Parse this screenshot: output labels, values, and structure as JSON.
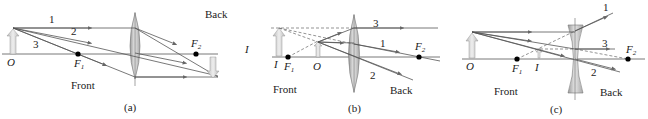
{
  "panels": [
    {
      "id": "a",
      "caption": "(a)",
      "lens_type": "converging",
      "labels": {
        "front": "Front",
        "back": "Back",
        "object": "O",
        "image": "I",
        "f1": "F",
        "f1_sub": "1",
        "f2": "F",
        "f2_sub": "2"
      },
      "rays": [
        "1",
        "2",
        "3"
      ]
    },
    {
      "id": "b",
      "caption": "(b)",
      "lens_type": "converging",
      "labels": {
        "front": "Front",
        "back": "Back",
        "object": "O",
        "image": "I",
        "f1": "F",
        "f1_sub": "1",
        "f2": "F",
        "f2_sub": "2"
      },
      "rays": [
        "3",
        "1",
        "2"
      ]
    },
    {
      "id": "c",
      "caption": "(c)",
      "lens_type": "diverging",
      "labels": {
        "front": "Front",
        "back": "Back",
        "object": "O",
        "image": "I",
        "f1": "F",
        "f1_sub": "1",
        "f2": "F",
        "f2_sub": "2"
      },
      "rays": [
        "1",
        "3",
        "2"
      ]
    }
  ],
  "colors": {
    "ray": "#555555",
    "axis": "#444444",
    "lens_fill": "#c9c9c9",
    "arrow_fill": "#dcdcdc",
    "focal_point": "#000000"
  }
}
